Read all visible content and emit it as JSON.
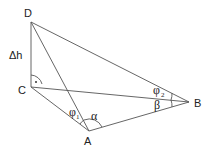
{
  "diagram": {
    "points": {
      "D": {
        "label": "D",
        "x": 31,
        "y": 22
      },
      "C": {
        "label": "C",
        "x": 31,
        "y": 87
      },
      "A": {
        "label": "A",
        "x": 89,
        "y": 131
      },
      "B": {
        "label": "B",
        "x": 189,
        "y": 102
      }
    },
    "labels": {
      "height": "Δh",
      "alpha": "α",
      "beta": "β",
      "phi": "φ",
      "phi1_sub": "1",
      "phi2_sub": "2"
    },
    "segments": [
      "DC",
      "DA",
      "DB",
      "CA",
      "CB",
      "AB"
    ],
    "right_angle_at": "C"
  }
}
